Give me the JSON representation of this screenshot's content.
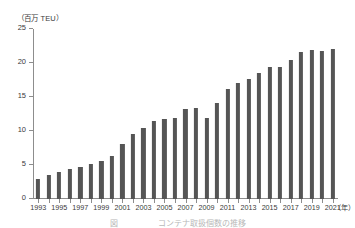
{
  "chart_data": {
    "type": "bar",
    "title": "",
    "ylabel": "（百万 TEU）",
    "xlabel": "（年）",
    "ylim": [
      0,
      25
    ],
    "yticks": [
      0,
      5,
      10,
      15,
      20,
      25
    ],
    "ytick_labels": [
      "0",
      "5",
      "10",
      "15",
      "20",
      "25"
    ],
    "grid": false,
    "legend": null,
    "bar_color": "#555555",
    "axis_color": "#8d8d8d",
    "categories": [
      "1993",
      "1994",
      "1995",
      "1996",
      "1997",
      "1998",
      "1999",
      "2000",
      "2001",
      "2002",
      "2003",
      "2004",
      "2005",
      "2006",
      "2007",
      "2008",
      "2009",
      "2010",
      "2011",
      "2012",
      "2013",
      "2014",
      "2015",
      "2016",
      "2017",
      "2018",
      "2019",
      "2020",
      "2021"
    ],
    "labeled_categories": [
      "1993",
      "1995",
      "1997",
      "1999",
      "2001",
      "2003",
      "2005",
      "2007",
      "2009",
      "2011",
      "2013",
      "2015",
      "2017",
      "2019",
      "2021"
    ],
    "values": [
      3.0,
      3.5,
      4.0,
      4.4,
      4.7,
      5.2,
      5.6,
      6.3,
      8.1,
      9.5,
      10.4,
      11.4,
      11.7,
      11.9,
      13.2,
      13.4,
      11.9,
      14.1,
      16.2,
      17.0,
      17.7,
      18.6,
      19.4,
      19.4,
      20.5,
      21.6,
      21.9,
      21.8,
      22.7
    ],
    "series": [
      {
        "name": "コンテナ取扱個数",
        "values": [
          3.0,
          3.5,
          4.0,
          4.4,
          4.7,
          5.2,
          5.6,
          6.3,
          8.1,
          9.5,
          10.4,
          11.4,
          11.7,
          11.9,
          13.2,
          13.4,
          11.9,
          14.1,
          16.2,
          17.0,
          17.7,
          18.6,
          19.4,
          19.4,
          20.5,
          21.6,
          21.9,
          21.8,
          22.7
        ]
      }
    ],
    "last_bar_note": "2021 bar drawn at 22.1"
  },
  "figure": {
    "y_unit_caption": "（百万 TEU）",
    "x_unit_caption": "（年）",
    "caption_text": "図　　　　　コンテナ取扱個数の推移"
  }
}
